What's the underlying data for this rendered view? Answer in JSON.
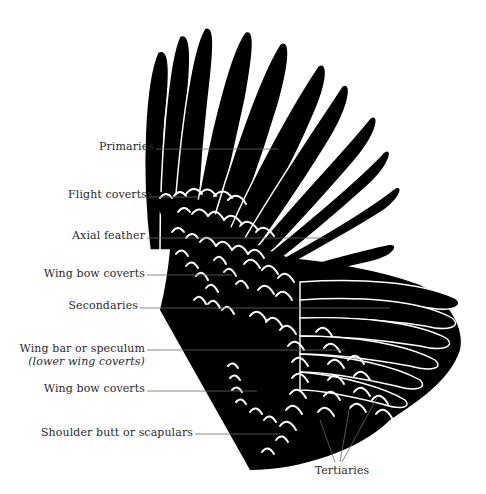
{
  "diagram": {
    "colors": {
      "wing": "#000000",
      "feather_edge": "#ffffff",
      "leader_line": "#6b6b6b",
      "text": "#2a2a2a",
      "background": "#ffffff"
    },
    "labels": [
      {
        "id": "primaries",
        "text": "Primaries",
        "x": 154,
        "y": 146
      },
      {
        "id": "flight-coverts",
        "text": "Flight coverts",
        "x": 147,
        "y": 194
      },
      {
        "id": "axial-feather",
        "text": "Axial feather",
        "x": 145,
        "y": 235
      },
      {
        "id": "wing-bow-coverts-upper",
        "text": "Wing bow coverts",
        "x": 145,
        "y": 273
      },
      {
        "id": "secondaries",
        "text": "Secondaries",
        "x": 138,
        "y": 305
      },
      {
        "id": "wing-bar",
        "text": "Wing bar or speculum",
        "subtext": "(lower wing coverts)",
        "x": 145,
        "y": 348
      },
      {
        "id": "wing-bow-coverts-lower",
        "text": "Wing bow coverts",
        "x": 145,
        "y": 388
      },
      {
        "id": "shoulder-butt",
        "text": "Shoulder butt or scapulars",
        "x": 193,
        "y": 432
      },
      {
        "id": "tertiaries",
        "text": "Tertiaries",
        "x": 340,
        "y": 469
      }
    ]
  }
}
